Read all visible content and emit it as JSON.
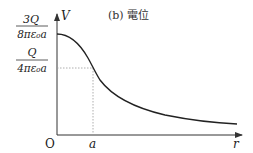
{
  "title": "(b) 電位",
  "axes": {
    "y_label": "V",
    "x_label": "r",
    "origin_label": "O",
    "x_tick_label": "a"
  },
  "y_ticks": [
    {
      "numerator": "3Q",
      "denominator": "8πε₀a"
    },
    {
      "numerator": "Q",
      "denominator": "4πε₀a"
    }
  ],
  "colors": {
    "curve": "#222222",
    "axis": "#333333",
    "guide": "#999999"
  }
}
